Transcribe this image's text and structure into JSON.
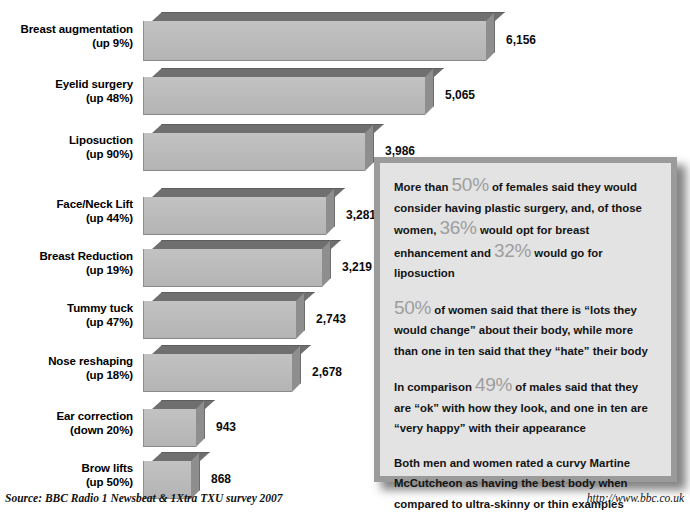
{
  "chart_data": {
    "type": "bar",
    "orientation": "horizontal",
    "title": "",
    "xlabel": "",
    "ylabel": "",
    "grid": false,
    "legend": null,
    "xlim": [
      0,
      6156
    ],
    "categories": [
      "Breast augmentation",
      "Eyelid surgery",
      "Liposuction",
      "Face/Neck Lift",
      "Breast Reduction",
      "Tummy tuck",
      "Nose reshaping",
      "Ear correction",
      "Brow lifts"
    ],
    "values": [
      6156,
      5065,
      3986,
      3281,
      3219,
      2743,
      2678,
      943,
      868
    ],
    "value_labels": [
      "6,156",
      "5,065",
      "3,986",
      "3,281",
      "3,219",
      "2,743",
      "2,678",
      "943",
      "868"
    ],
    "change_labels": [
      "(up 9%)",
      "(up 48%)",
      "(up 90%)",
      "(up 44%)",
      "(up 19%)",
      "(up 47%)",
      "(up 18%)",
      "(down 20%)",
      "(up 50%)"
    ],
    "bar_color": "#bdbdbd",
    "bar_top_color": "#6f6f6f",
    "bar_side_color": "#8e8e8e"
  },
  "rows": [
    {
      "label": "Breast augmentation",
      "change": "(up 9%)",
      "value_label": "6,156",
      "value": 6156
    },
    {
      "label": "Eyelid surgery",
      "change": "(up 48%)",
      "value_label": "5,065",
      "value": 5065
    },
    {
      "label": "Liposuction",
      "change": "(up 90%)",
      "value_label": "3,986",
      "value": 3986
    },
    {
      "label": "Face/Neck Lift",
      "change": "(up 44%)",
      "value_label": "3,281",
      "value": 3281
    },
    {
      "label": "Breast Reduction",
      "change": "(up 19%)",
      "value_label": "3,219",
      "value": 3219
    },
    {
      "label": "Tummy tuck",
      "change": "(up 47%)",
      "value_label": "2,743",
      "value": 2743
    },
    {
      "label": "Nose reshaping",
      "change": "(up 18%)",
      "value_label": "2,678",
      "value": 2678
    },
    {
      "label": "Ear correction",
      "change": "(down 20%)",
      "value_label": "943",
      "value": 943
    },
    {
      "label": "Brow lifts",
      "change": "(up 50%)",
      "value_label": "868",
      "value": 868
    }
  ],
  "panel": {
    "paragraphs": [
      {
        "segments": [
          {
            "text": "More than ",
            "style": "normal"
          },
          {
            "text": "50%",
            "style": "pct"
          },
          {
            "text": " of females said they would consider having plastic surgery, and, of those women, ",
            "style": "normal"
          },
          {
            "text": "36%",
            "style": "pct"
          },
          {
            "text": " would opt for breast enhancement and ",
            "style": "normal"
          },
          {
            "text": "32%",
            "style": "pct"
          },
          {
            "text": " would go for liposuction",
            "style": "normal"
          }
        ]
      },
      {
        "segments": [
          {
            "text": "50%",
            "style": "pct"
          },
          {
            "text": " of women said that there is “lots they would change” about their body, while more than one in ten said that they “hate” their body",
            "style": "normal"
          }
        ]
      },
      {
        "segments": [
          {
            "text": "In comparison ",
            "style": "normal"
          },
          {
            "text": "49%",
            "style": "pct"
          },
          {
            "text": " of males said that they are “ok” with how they look, and one in ten are “very happy” with their appearance",
            "style": "normal"
          }
        ]
      },
      {
        "segments": [
          {
            "text": "Both men and women rated a curvy Martine McCutcheon as having the best body when compared to ultra-skinny or thin examples",
            "style": "normal"
          }
        ]
      }
    ],
    "border_color": "#9b9b9b",
    "background_color": "#e3e3e3",
    "percent_color": "#9e9e9e"
  },
  "footer": {
    "source": "Source: BBC Radio 1 Newsbeat & 1Xtra TXU survey 2007",
    "url": "http://www.bbc.co.uk"
  }
}
